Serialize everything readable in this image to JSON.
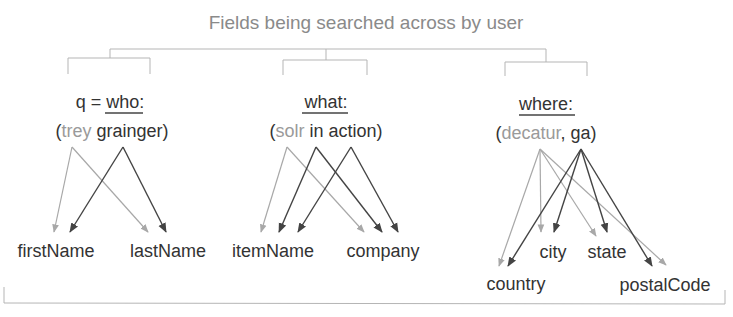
{
  "title": "Fields being searched across by user",
  "colors": {
    "light_term": "#9a9a9a",
    "dark_term": "#333333",
    "light_arrow": "#a8a8a8",
    "dark_arrow": "#444444",
    "bracket": "#b5b5b5"
  },
  "groups": [
    {
      "id": "who",
      "prefix": "q = ",
      "label": "who:",
      "open": "(",
      "terms": [
        {
          "text": "trey",
          "tone": "light",
          "sep": " "
        },
        {
          "text": "grainger",
          "tone": "dark",
          "sep": ""
        }
      ],
      "close": ")",
      "fields": [
        "firstName",
        "lastName"
      ]
    },
    {
      "id": "what",
      "prefix": "",
      "label": "what:",
      "open": "(",
      "terms": [
        {
          "text": "solr",
          "tone": "light",
          "sep": " "
        },
        {
          "text": "in",
          "tone": "dark",
          "sep": " "
        },
        {
          "text": "action",
          "tone": "dark",
          "sep": ""
        }
      ],
      "close": ")",
      "fields": [
        "itemName",
        "company"
      ]
    },
    {
      "id": "where",
      "prefix": "",
      "label": "where:",
      "open": "(",
      "terms": [
        {
          "text": "decatur",
          "tone": "light",
          "sep": ", "
        },
        {
          "text": "ga",
          "tone": "dark",
          "sep": ""
        }
      ],
      "close": ")",
      "fields": [
        "country",
        "city",
        "state",
        "postalCode"
      ]
    }
  ],
  "edges": [
    {
      "from": "trey",
      "to": "firstName",
      "tone": "light"
    },
    {
      "from": "trey",
      "to": "lastName",
      "tone": "light"
    },
    {
      "from": "grainger",
      "to": "firstName",
      "tone": "dark"
    },
    {
      "from": "grainger",
      "to": "lastName",
      "tone": "dark"
    },
    {
      "from": "solr",
      "to": "itemName",
      "tone": "light"
    },
    {
      "from": "solr",
      "to": "company",
      "tone": "light"
    },
    {
      "from": "in",
      "to": "itemName",
      "tone": "dark"
    },
    {
      "from": "in",
      "to": "company",
      "tone": "dark"
    },
    {
      "from": "action",
      "to": "itemName",
      "tone": "dark"
    },
    {
      "from": "action",
      "to": "company",
      "tone": "dark"
    },
    {
      "from": "decatur",
      "to": "country",
      "tone": "light"
    },
    {
      "from": "decatur",
      "to": "city",
      "tone": "light"
    },
    {
      "from": "decatur",
      "to": "state",
      "tone": "light"
    },
    {
      "from": "decatur",
      "to": "postalCode",
      "tone": "light"
    },
    {
      "from": "ga",
      "to": "country",
      "tone": "dark"
    },
    {
      "from": "ga",
      "to": "city",
      "tone": "dark"
    },
    {
      "from": "ga",
      "to": "state",
      "tone": "dark"
    },
    {
      "from": "ga",
      "to": "postalCode",
      "tone": "dark"
    }
  ]
}
